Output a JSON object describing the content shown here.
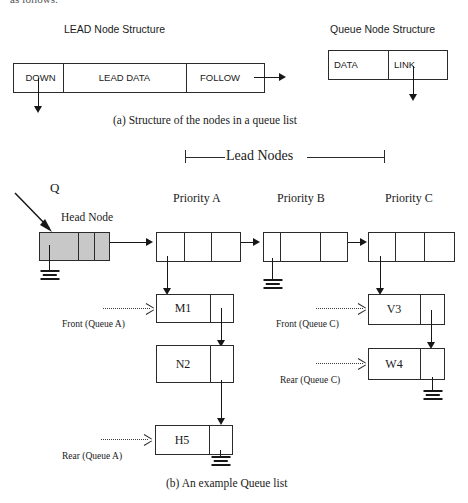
{
  "page": {
    "top_cut_text": "as follows:",
    "caption_a": "(a) Structure of the nodes in a queue list",
    "caption_b": "(b) An example Queue list"
  },
  "part_a": {
    "lead_node": {
      "title": "LEAD Node Structure",
      "fields": [
        "DOWN",
        "LEAD DATA",
        "FOLLOW"
      ]
    },
    "queue_node": {
      "title": "Queue Node Structure",
      "fields": [
        "DATA",
        "LINK"
      ]
    }
  },
  "part_b": {
    "bracket_label": "Lead Nodes",
    "pointer_label": "Q",
    "head_node_label": "Head Node",
    "lead_nodes": [
      {
        "label": "Priority A"
      },
      {
        "label": "Priority B"
      },
      {
        "label": "Priority C"
      }
    ],
    "queue_a": {
      "nodes": [
        "M1",
        "N2",
        "H5"
      ],
      "front_label": "Front (Queue A)",
      "rear_label": "Rear (Queue A)"
    },
    "queue_c": {
      "nodes": [
        "V3",
        "W4"
      ],
      "front_label": "Front (Queue C)",
      "rear_label": "Rear (Queue C)"
    }
  },
  "colors": {
    "ink": "#1a1a1a",
    "line": "#171717",
    "head_node_fill": "#c8c8c8",
    "background": "#ffffff"
  }
}
